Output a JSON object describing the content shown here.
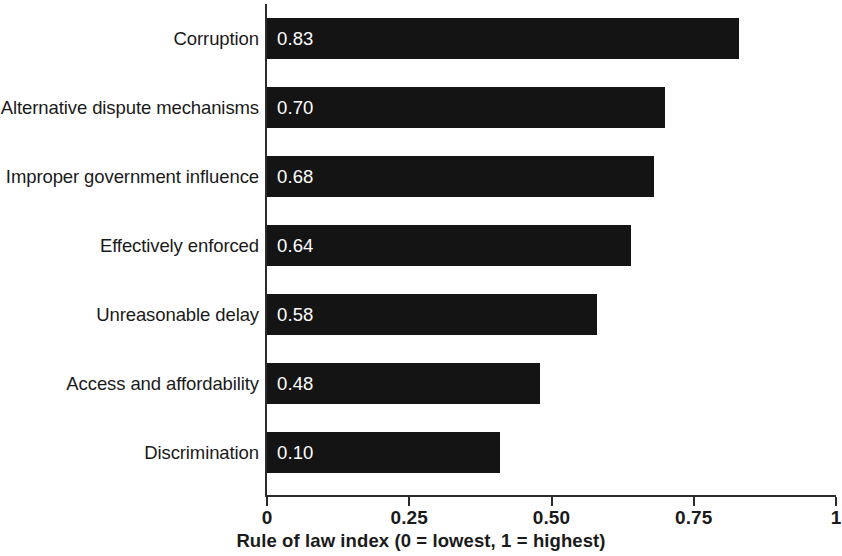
{
  "chart_data": {
    "type": "bar",
    "orientation": "horizontal",
    "title": "",
    "xlabel": "Rule of law index (0 = lowest, 1 = highest)",
    "ylabel": "",
    "xlim": [
      0,
      1
    ],
    "grid": false,
    "legend": null,
    "bar_color": "#141414",
    "axis_color": "#2b2b2b",
    "value_label_color": "#ffffff",
    "categories": [
      "Corruption",
      "Alternative dispute mechanisms",
      "Improper government influence",
      "Effectively enforced",
      "Unreasonable delay",
      "Access and affordability",
      "Discrimination"
    ],
    "values": [
      0.83,
      0.7,
      0.68,
      0.64,
      0.58,
      0.48,
      0.41
    ],
    "value_labels": [
      "0.83",
      "0.70",
      "0.68",
      "0.64",
      "0.58",
      "0.48",
      "0.10"
    ],
    "bars": [
      {
        "category": "Corruption",
        "value": 0.83,
        "label": "0.83"
      },
      {
        "category": "Alternative dispute mechanisms",
        "value": 0.7,
        "label": "0.70"
      },
      {
        "category": "Improper government influence",
        "value": 0.68,
        "label": "0.68"
      },
      {
        "category": "Effectively enforced",
        "value": 0.64,
        "label": "0.64"
      },
      {
        "category": "Unreasonable delay",
        "value": 0.58,
        "label": "0.58"
      },
      {
        "category": "Access and affordability",
        "value": 0.48,
        "label": "0.48"
      },
      {
        "category": "Discrimination",
        "value": 0.41,
        "label": "0.10"
      }
    ],
    "xticks": [
      0,
      0.25,
      0.5,
      0.75,
      1
    ],
    "xtick_labels": [
      "0",
      "0.25",
      "0.50",
      "0.75",
      "1"
    ]
  }
}
